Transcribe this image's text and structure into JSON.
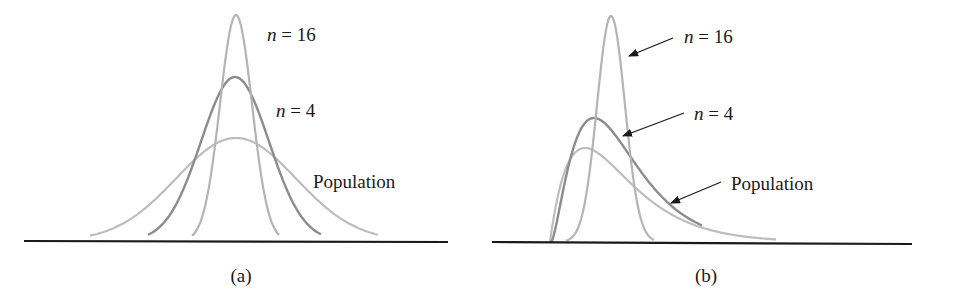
{
  "chart_data": [
    {
      "type": "line",
      "panel_label": "(a)",
      "title": "Symmetric population: sampling distributions of the mean",
      "xlabel": "",
      "ylabel": "",
      "grid": false,
      "series": [
        {
          "name": "n = 16",
          "shape": "normal",
          "center": 0,
          "relative_sd": 0.25,
          "relative_peak": 4.0,
          "color": "#b4b4b4"
        },
        {
          "name": "n = 4",
          "shape": "normal",
          "center": 0,
          "relative_sd": 0.5,
          "relative_peak": 2.0,
          "color": "#8c8c8c"
        },
        {
          "name": "Population",
          "shape": "normal",
          "center": 0,
          "relative_sd": 1.0,
          "relative_peak": 1.0,
          "color": "#bdbdbd"
        }
      ],
      "annotations": [
        "n = 16",
        "n = 4",
        "Population"
      ]
    },
    {
      "type": "line",
      "panel_label": "(b)",
      "title": "Skewed population: sampling distributions of the mean",
      "xlabel": "",
      "ylabel": "",
      "grid": false,
      "series": [
        {
          "name": "n = 16",
          "shape": "near-normal",
          "relative_peak": 2.4,
          "color": "#b4b4b4"
        },
        {
          "name": "n = 4",
          "shape": "slightly right-skewed",
          "relative_peak": 1.3,
          "color": "#8c8c8c"
        },
        {
          "name": "Population",
          "shape": "right-skewed",
          "relative_peak": 1.0,
          "color": "#bdbdbd"
        }
      ],
      "annotations": [
        "n = 16",
        "n = 4",
        "Population"
      ],
      "arrows": true
    }
  ],
  "panels": {
    "a": {
      "caption": "(a)",
      "label_n16_var": "n",
      "label_n16_rest": " = 16",
      "label_n4_var": "n",
      "label_n4_rest": " = 4",
      "label_pop": "Population"
    },
    "b": {
      "caption": "(b)",
      "label_n16_var": "n",
      "label_n16_rest": " = 16",
      "label_n4_var": "n",
      "label_n4_rest": " = 4",
      "label_pop": "Population"
    }
  },
  "colors": {
    "axis": "#1a1a1a",
    "n16": "#b4b4b4",
    "n4": "#8c8c8c",
    "population": "#bdbdbd",
    "text": "#1a1a1a"
  }
}
